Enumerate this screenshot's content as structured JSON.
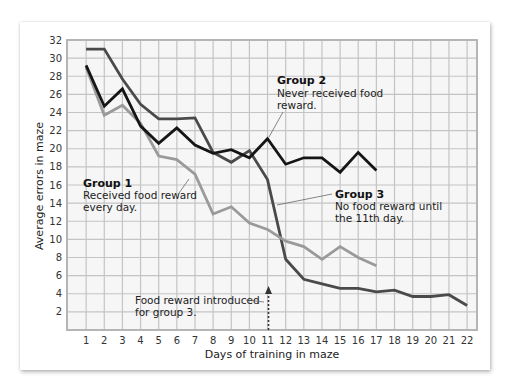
{
  "chart_data": {
    "type": "line",
    "title": "",
    "xlabel": "Days of training in maze",
    "ylabel": "Average errors in maze",
    "x": [
      1,
      2,
      3,
      4,
      5,
      6,
      7,
      8,
      9,
      10,
      11,
      12,
      13,
      14,
      15,
      16,
      17,
      18,
      19,
      20,
      21,
      22
    ],
    "xlim": [
      0,
      22.5
    ],
    "ylim": [
      0,
      32
    ],
    "yticks": [
      2,
      4,
      6,
      8,
      10,
      12,
      14,
      16,
      18,
      20,
      22,
      24,
      26,
      28,
      30,
      32
    ],
    "xticks": [
      1,
      2,
      3,
      4,
      5,
      6,
      7,
      8,
      9,
      10,
      11,
      12,
      13,
      14,
      15,
      16,
      17,
      18,
      19,
      20,
      21,
      22
    ],
    "grid": true,
    "legend": "inline annotations",
    "series": [
      {
        "name": "Group 1",
        "description": "Received food reward every day.",
        "color": "#9a9a9a",
        "x": [
          1,
          2,
          3,
          4,
          5,
          6,
          7,
          8,
          9,
          10,
          11,
          12,
          13,
          14,
          15,
          16,
          17
        ],
        "values": [
          29.0,
          23.7,
          24.8,
          22.8,
          19.2,
          18.8,
          17.2,
          12.8,
          13.6,
          11.8,
          11.1,
          9.8,
          9.2,
          7.8,
          9.2,
          8.0,
          7.1
        ]
      },
      {
        "name": "Group 2",
        "description": "Never received food reward.",
        "color": "#151515",
        "x": [
          1,
          2,
          3,
          4,
          5,
          6,
          7,
          8,
          9,
          10,
          11,
          12,
          13,
          14,
          15,
          16,
          17
        ],
        "values": [
          29.2,
          24.7,
          26.6,
          22.5,
          20.6,
          22.3,
          20.4,
          19.5,
          19.9,
          19.0,
          21.1,
          18.3,
          19.0,
          19.0,
          17.4,
          19.6,
          17.6
        ]
      },
      {
        "name": "Group 3",
        "description": "No food reward until the 11th day.",
        "color": "#4a4a4a",
        "x": [
          1,
          2,
          3,
          4,
          5,
          6,
          7,
          8,
          9,
          10,
          11,
          12,
          13,
          14,
          15,
          16,
          17,
          18,
          19,
          20,
          21,
          22
        ],
        "values": [
          31.0,
          31.0,
          27.7,
          24.9,
          23.3,
          23.3,
          23.4,
          19.6,
          18.5,
          19.8,
          16.6,
          7.8,
          5.6,
          5.1,
          4.6,
          4.6,
          4.2,
          4.4,
          3.7,
          3.7,
          3.9,
          2.7
        ]
      }
    ],
    "annotations": [
      {
        "text": "Food reward introduced for group 3.",
        "x": 11,
        "arrow": "dotted upward arrow at day 11"
      }
    ]
  },
  "labels": {
    "xlabel": "Days of training in maze",
    "ylabel": "Average errors in maze",
    "group1_title": "Group 1",
    "group1_line1": "Received food reward",
    "group1_line2": "every day.",
    "group2_title": "Group 2",
    "group2_line1": "Never received food",
    "group2_line2": "reward.",
    "group3_title": "Group 3",
    "group3_line1": "No food reward until",
    "group3_line2": "the 11th day.",
    "food_line1": "Food reward introduced",
    "food_line2": "for group 3."
  },
  "colors": {
    "grid": "#c4c4c4",
    "plot_bg": "#f6f6f6",
    "frame": "#b5b5b5"
  }
}
